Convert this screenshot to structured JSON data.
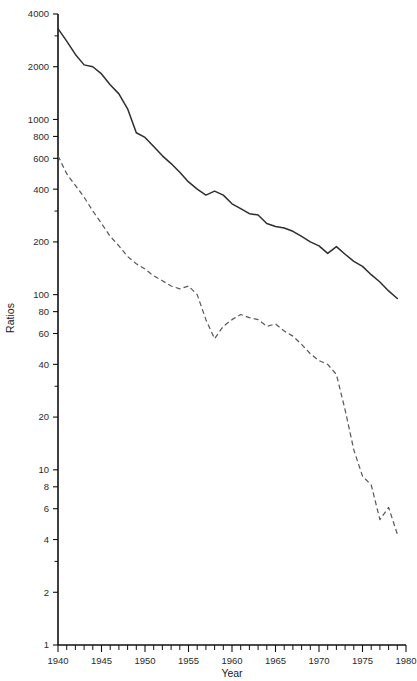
{
  "chart_data": {
    "type": "line",
    "title": "",
    "xlabel": "Year",
    "ylabel": "Ratios",
    "yscale": "log",
    "ylim": [
      1,
      4000
    ],
    "xlim": [
      1940,
      1980
    ],
    "grid": false,
    "legend": "none",
    "y_tick_labels": [
      "1",
      "2",
      "4",
      "6",
      "8",
      "10",
      "20",
      "40",
      "60",
      "80",
      "100",
      "200",
      "400",
      "600",
      "800",
      "1000",
      "2000",
      "4000"
    ],
    "y_tick_values": [
      1,
      2,
      4,
      6,
      8,
      10,
      20,
      40,
      60,
      80,
      100,
      200,
      400,
      600,
      800,
      1000,
      2000,
      4000
    ],
    "y_minor_tick_values": [
      3,
      30,
      300,
      3000
    ],
    "x_tick_labels": [
      "1940",
      "1945",
      "1950",
      "1955",
      "1960",
      "1965",
      "1970",
      "1975",
      "1980"
    ],
    "x_tick_values": [
      1940,
      1945,
      1950,
      1955,
      1960,
      1965,
      1970,
      1975,
      1980
    ],
    "x_minor_step": 1,
    "x": [
      1940,
      1941,
      1942,
      1943,
      1944,
      1945,
      1946,
      1947,
      1948,
      1949,
      1950,
      1951,
      1952,
      1953,
      1954,
      1955,
      1956,
      1957,
      1958,
      1959,
      1960,
      1961,
      1962,
      1963,
      1964,
      1965,
      1966,
      1967,
      1968,
      1969,
      1970,
      1971,
      1972,
      1973,
      1974,
      1975,
      1976,
      1977,
      1978,
      1979
    ],
    "series": [
      {
        "name": "solid-series",
        "style": "solid",
        "color": "#2e2e2e",
        "values": [
          3300,
          2800,
          2350,
          2050,
          2000,
          1820,
          1580,
          1400,
          1150,
          840,
          790,
          700,
          620,
          560,
          500,
          440,
          400,
          370,
          390,
          370,
          330,
          310,
          290,
          285,
          255,
          245,
          240,
          230,
          215,
          200,
          190,
          172,
          188,
          170,
          155,
          145,
          130,
          118,
          105,
          95
        ]
      },
      {
        "name": "dashed-series",
        "style": "dashed",
        "color": "#5a5a5a",
        "values": [
          620,
          490,
          420,
          360,
          300,
          255,
          215,
          190,
          165,
          150,
          140,
          128,
          120,
          112,
          108,
          112,
          100,
          72,
          56,
          66,
          72,
          77,
          74,
          72,
          66,
          68,
          62,
          58,
          52,
          46,
          42,
          40,
          35,
          22,
          13,
          9.2,
          8.2,
          5.2,
          6.1,
          4.3
        ]
      }
    ]
  }
}
